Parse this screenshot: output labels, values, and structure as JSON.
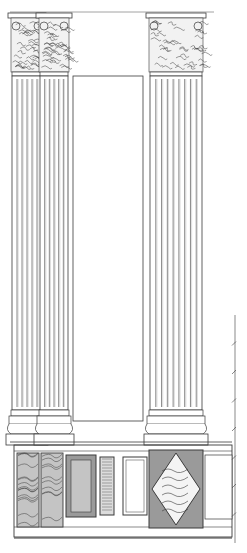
{
  "drawing": {
    "title": "",
    "type": "architectural-elevation",
    "subject": "Corinthian pilasters with marble-panelled pedestal",
    "colors": {
      "line": "#3a3a3a",
      "light_line": "#8a8a8a",
      "marble_dark": "#9a9a9a",
      "marble_mid": "#c4c4c4",
      "paper": "#ffffff"
    }
  },
  "columns": [
    {
      "name": "left-outer-column",
      "x": 12,
      "w": 30,
      "flutes": 6
    },
    {
      "name": "left-inner-column",
      "x": 40,
      "w": 28,
      "flutes": 6
    },
    {
      "name": "right-column",
      "x": 150,
      "w": 52,
      "flutes": 9
    }
  ],
  "entablature": {
    "y": 12,
    "x1": 10,
    "x2": 214
  },
  "center_panel": {
    "x": 73,
    "y": 76,
    "w": 70,
    "h": 345
  },
  "pedestal": {
    "y_top": 445,
    "y_bottom": 537
  },
  "scale_bar": {
    "x": 235,
    "y_top": 315,
    "y_bottom": 543,
    "ticks": 7
  }
}
